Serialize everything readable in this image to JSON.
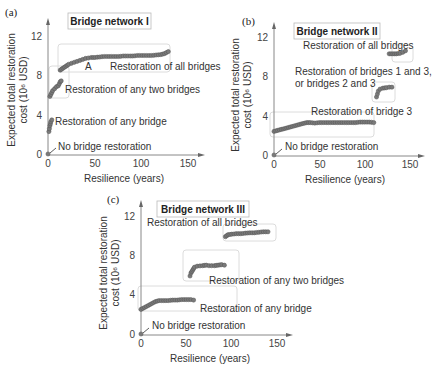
{
  "figure": {
    "axis_common": {
      "xlabel": "Resilience (years)",
      "ylabel_line1": "Expected total restoration",
      "ylabel_line2": "cost (10⁶ USD)",
      "x_ticks": [
        "0",
        "50",
        "100",
        "150"
      ],
      "y_ticks": [
        "0",
        "4",
        "8",
        "12"
      ]
    },
    "colors": {
      "dot_fill": "#7a7a7a",
      "dot_stroke": "#555555",
      "axis": "#888888",
      "box": "#dcdcdc"
    }
  },
  "chart_data": [
    {
      "type": "scatter",
      "panel": "(a)",
      "title": "Bridge network I",
      "xlabel": "Resilience (years)",
      "ylabel": "Expected total restoration cost (10⁶ USD)",
      "xlim": [
        0,
        150
      ],
      "ylim": [
        0,
        12
      ],
      "x_ticks": [
        0,
        50,
        100,
        150
      ],
      "y_ticks": [
        0,
        4,
        8,
        12
      ],
      "grid": false,
      "series": [
        {
          "name": "No bridge restoration",
          "points": [
            [
              0,
              0
            ]
          ]
        },
        {
          "name": "Restoration of any bridge",
          "points": [
            [
              1,
              2.3
            ],
            [
              1.5,
              2.6
            ],
            [
              2,
              2.9
            ],
            [
              2.5,
              3.1
            ],
            [
              3,
              3.3
            ],
            [
              4,
              3.5
            ]
          ]
        },
        {
          "name": "Restoration of any two bridges",
          "points": [
            [
              2,
              5.9
            ],
            [
              3,
              6.1
            ],
            [
              4,
              6.3
            ],
            [
              5,
              6.5
            ],
            [
              7,
              6.7
            ],
            [
              9,
              6.9
            ],
            [
              11,
              7.0
            ],
            [
              12,
              7.2
            ],
            [
              13,
              7.4
            ],
            [
              14,
              7.5
            ]
          ]
        },
        {
          "name": "Restoration of all bridges",
          "points": [
            [
              13,
              8.6
            ],
            [
              16,
              8.8
            ],
            [
              19,
              9.0
            ],
            [
              22,
              9.2
            ],
            [
              25,
              9.3
            ],
            [
              28,
              9.4
            ],
            [
              31,
              9.5
            ],
            [
              34,
              9.6
            ],
            [
              37,
              9.7
            ],
            [
              40,
              9.8
            ],
            [
              43,
              9.85
            ],
            [
              46,
              9.9
            ],
            [
              50,
              9.9
            ],
            [
              55,
              9.95
            ],
            [
              60,
              10.0
            ],
            [
              65,
              10.0
            ],
            [
              70,
              10.0
            ],
            [
              75,
              10.0
            ],
            [
              80,
              10.05
            ],
            [
              85,
              10.05
            ],
            [
              90,
              10.05
            ],
            [
              95,
              10.1
            ],
            [
              100,
              10.1
            ],
            [
              105,
              10.1
            ],
            [
              110,
              10.1
            ],
            [
              115,
              10.15
            ],
            [
              120,
              10.2
            ],
            [
              124,
              10.3
            ],
            [
              128,
              10.5
            ]
          ]
        }
      ],
      "annotations": [
        "A",
        "Restoration of all bridges",
        "Restoration of any two bridges",
        "Restoration of any bridge",
        "No bridge restoration"
      ]
    },
    {
      "type": "scatter",
      "panel": "(b)",
      "title": "Bridge network II",
      "xlabel": "Resilience (years)",
      "ylabel": "Expected total restoration cost (10⁶ USD)",
      "xlim": [
        0,
        150
      ],
      "ylim": [
        0,
        12
      ],
      "x_ticks": [
        0,
        50,
        100,
        150
      ],
      "y_ticks": [
        0,
        4,
        8,
        12
      ],
      "grid": false,
      "series": [
        {
          "name": "No bridge restoration",
          "points": [
            [
              0,
              0
            ]
          ]
        },
        {
          "name": "Restoration of bridge 3",
          "points": [
            [
              0,
              2.4
            ],
            [
              4,
              2.5
            ],
            [
              8,
              2.6
            ],
            [
              12,
              2.7
            ],
            [
              16,
              2.8
            ],
            [
              20,
              2.9
            ],
            [
              24,
              3.0
            ],
            [
              28,
              3.1
            ],
            [
              32,
              3.2
            ],
            [
              36,
              3.3
            ],
            [
              40,
              3.3
            ],
            [
              45,
              3.25
            ],
            [
              50,
              3.3
            ],
            [
              55,
              3.3
            ],
            [
              60,
              3.3
            ],
            [
              65,
              3.3
            ],
            [
              70,
              3.3
            ],
            [
              75,
              3.3
            ],
            [
              80,
              3.3
            ],
            [
              85,
              3.3
            ],
            [
              90,
              3.3
            ],
            [
              95,
              3.35
            ],
            [
              100,
              3.35
            ],
            [
              105,
              3.35
            ],
            [
              110,
              3.3
            ]
          ]
        },
        {
          "name": "Restoration of bridges 1 and 3, or bridges 2 and 3",
          "points": [
            [
              113,
              5.9
            ],
            [
              114,
              6.2
            ],
            [
              115,
              6.5
            ],
            [
              117,
              6.7
            ],
            [
              120,
              6.8
            ],
            [
              124,
              6.85
            ],
            [
              127,
              6.9
            ],
            [
              130,
              6.9
            ]
          ]
        },
        {
          "name": "Restoration of all bridges",
          "points": [
            [
              127,
              10.3
            ],
            [
              131,
              10.3
            ],
            [
              135,
              10.3
            ],
            [
              139,
              10.35
            ],
            [
              142,
              10.45
            ],
            [
              145,
              10.6
            ]
          ]
        }
      ],
      "annotations": [
        "Restoration of all bridges",
        "Restoration of bridges 1 and 3,",
        "or bridges 2 and 3",
        "Restoration of bridge 3",
        "No bridge restoration"
      ]
    },
    {
      "type": "scatter",
      "panel": "(c)",
      "title": "Bridge network III",
      "xlabel": "Resilience (years)",
      "ylabel": "Expected total restoration cost (10⁶ USD)",
      "xlim": [
        0,
        150
      ],
      "ylim": [
        0,
        12
      ],
      "x_ticks": [
        0,
        50,
        100,
        150
      ],
      "y_ticks": [
        0,
        4,
        8,
        12
      ],
      "grid": false,
      "series": [
        {
          "name": "No bridge restoration",
          "points": [
            [
              0,
              0
            ]
          ]
        },
        {
          "name": "Restoration of any bridge",
          "points": [
            [
              0,
              2.5
            ],
            [
              4,
              2.7
            ],
            [
              8,
              2.9
            ],
            [
              12,
              3.1
            ],
            [
              16,
              3.3
            ],
            [
              20,
              3.4
            ],
            [
              25,
              3.4
            ],
            [
              30,
              3.4
            ],
            [
              35,
              3.45
            ],
            [
              40,
              3.45
            ],
            [
              45,
              3.5
            ],
            [
              50,
              3.5
            ],
            [
              55,
              3.5
            ],
            [
              58,
              3.45
            ]
          ]
        },
        {
          "name": "Restoration of any two bridges",
          "points": [
            [
              54,
              5.9
            ],
            [
              55,
              6.2
            ],
            [
              57,
              6.5
            ],
            [
              59,
              6.8
            ],
            [
              62,
              6.9
            ],
            [
              68,
              6.95
            ],
            [
              72,
              7.0
            ],
            [
              75,
              6.95
            ],
            [
              81,
              6.95
            ],
            [
              85,
              7.0
            ],
            [
              89,
              7.05
            ],
            [
              92,
              7.0
            ]
          ]
        },
        {
          "name": "Restoration of all bridges",
          "points": [
            [
              93,
              9.9
            ],
            [
              96,
              10.1
            ],
            [
              100,
              10.15
            ],
            [
              105,
              10.2
            ],
            [
              110,
              10.2
            ],
            [
              115,
              10.25
            ],
            [
              120,
              10.3
            ],
            [
              125,
              10.3
            ],
            [
              130,
              10.35
            ],
            [
              135,
              10.4
            ],
            [
              140,
              10.4
            ]
          ]
        }
      ],
      "annotations": [
        "Restoration of all bridges",
        "Restoration of any two bridges",
        "Restoration of any bridge",
        "No bridge restoration"
      ]
    }
  ],
  "panels": [
    {
      "letter": "(a)",
      "title": "Bridge network I",
      "labels": {
        "point_a": "A",
        "all": "Restoration of all bridges",
        "two": "Restoration of any two bridges",
        "one": "Restoration of any bridge",
        "none": "No bridge restoration"
      }
    },
    {
      "letter": "(b)",
      "title": "Bridge network II",
      "labels": {
        "all": "Restoration of all bridges",
        "pair_line1": "Restoration of bridges 1 and 3,",
        "pair_line2": "or bridges 2 and 3",
        "one": "Restoration of bridge 3",
        "none": "No bridge restoration"
      }
    },
    {
      "letter": "(c)",
      "title": "Bridge network III",
      "labels": {
        "all": "Restoration of all bridges",
        "two": "Restoration of any two bridges",
        "one": "Restoration of any bridge",
        "none": "No bridge restoration"
      }
    }
  ]
}
